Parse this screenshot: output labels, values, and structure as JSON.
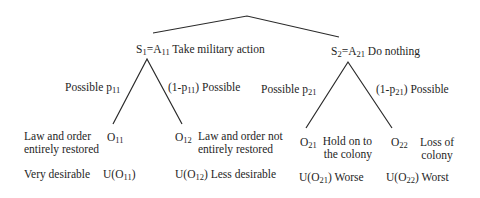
{
  "strategies": [
    {
      "id": "S1",
      "label_html_parts": {
        "s": "S",
        "s_sub": "1",
        "eq": "=A",
        "a_sub": "11"
      },
      "description": "Take military action"
    },
    {
      "id": "S2",
      "label_html_parts": {
        "s": "S",
        "s_sub": "2",
        "eq": "=A",
        "a_sub": "21"
      },
      "description": "Do nothing"
    }
  ],
  "branches": {
    "s1_left": {
      "prefix": "Possible p",
      "sub": "11"
    },
    "s1_right": {
      "prefix": "(1-p",
      "sub": "11",
      "suffix": ") Possible"
    },
    "s2_left": {
      "prefix": "Possible p",
      "sub": "21"
    },
    "s2_right": {
      "prefix": "(1-p",
      "sub": "21",
      "suffix": ") Possible"
    }
  },
  "outcomes": [
    {
      "o": "O",
      "sub": "11",
      "desc_line1": "Law and order",
      "desc_line2": "entirely restored",
      "utility_prefix": "U(O",
      "utility_sub": "11",
      "utility_suffix": ")",
      "rating": "Very desirable"
    },
    {
      "o": "O",
      "sub": "12",
      "desc_line1": "Law and order not",
      "desc_line2": "entirely restored",
      "utility_prefix": "U(O",
      "utility_sub": "12",
      "utility_suffix": ")",
      "rating": "Less desirable"
    },
    {
      "o": "O",
      "sub": "21",
      "desc_line1": "Hold on to",
      "desc_line2": "the colony",
      "utility_prefix": "U(O",
      "utility_sub": "21",
      "utility_suffix": ")",
      "rating": "Worse"
    },
    {
      "o": "O",
      "sub": "22",
      "desc_line1": "Loss of",
      "desc_line2": "colony",
      "utility_prefix": "U(O",
      "utility_sub": "22",
      "utility_suffix": ")",
      "rating": "Worst"
    }
  ],
  "colors": {
    "line": "#2a2a2a",
    "text": "#1e1e1e",
    "background": "#ffffff"
  }
}
